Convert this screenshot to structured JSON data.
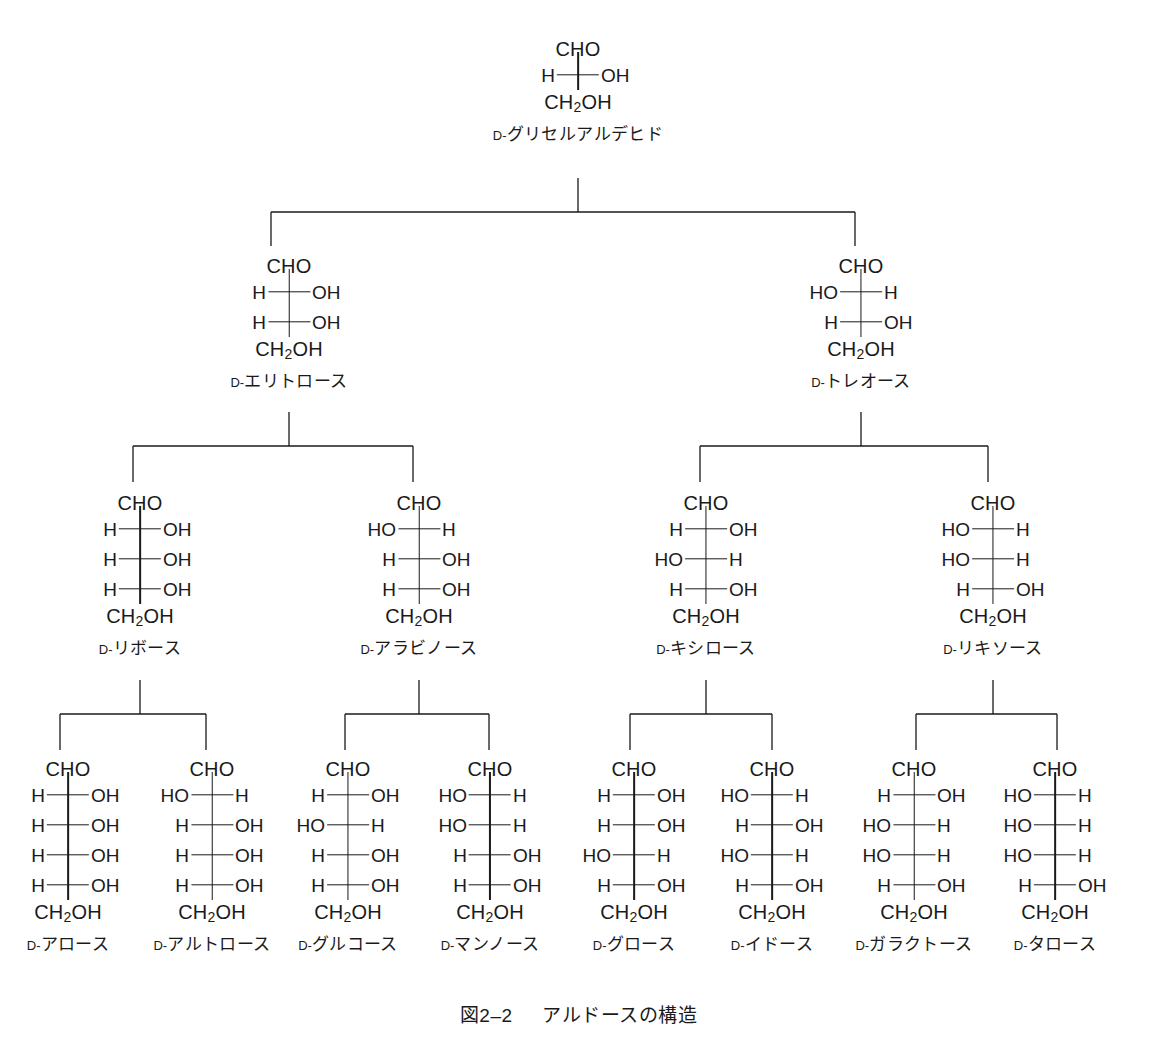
{
  "figure": {
    "caption_number": "図2–2",
    "caption_title": "アルドースの構造",
    "prefix": "D-",
    "aldehyde_group": "CHO",
    "primary_alcohol": "CH",
    "primary_alcohol_sub": "2",
    "primary_alcohol_tail": "OH",
    "hydroxyl_label": "OH",
    "hydrogen_label": "H",
    "hydroxyl_left_label": "HO"
  },
  "chart_data": {
    "type": "diagram",
    "generations": [
      {
        "level": 1,
        "carbons": 3,
        "label": "triose"
      },
      {
        "level": 2,
        "carbons": 4,
        "label": "tetrose"
      },
      {
        "level": 3,
        "carbons": 5,
        "label": "pentose"
      },
      {
        "level": 4,
        "carbons": 6,
        "label": "hexose"
      }
    ],
    "nodes": [
      {
        "id": "glyceraldehyde",
        "name": "グリセルアルデヒド",
        "prefix": "D-",
        "row": 1,
        "x": 578,
        "y": 38,
        "centers": [
          "R"
        ],
        "parent": null
      },
      {
        "id": "erythrose",
        "name": "エリトロース",
        "prefix": "D-",
        "row": 2,
        "x": 289,
        "y": 255,
        "centers": [
          "R",
          "R"
        ],
        "parent": "glyceraldehyde"
      },
      {
        "id": "threose",
        "name": "トレオース",
        "prefix": "D-",
        "row": 2,
        "x": 861,
        "y": 255,
        "centers": [
          "L",
          "R"
        ],
        "parent": "glyceraldehyde"
      },
      {
        "id": "ribose",
        "name": "リボース",
        "prefix": "D-",
        "row": 3,
        "x": 140,
        "y": 492,
        "centers": [
          "R",
          "R",
          "R"
        ],
        "parent": "erythrose"
      },
      {
        "id": "arabinose",
        "name": "アラビノース",
        "prefix": "D-",
        "row": 3,
        "x": 419,
        "y": 492,
        "centers": [
          "L",
          "R",
          "R"
        ],
        "parent": "erythrose"
      },
      {
        "id": "xylose",
        "name": "キシロース",
        "prefix": "D-",
        "row": 3,
        "x": 706,
        "y": 492,
        "centers": [
          "R",
          "L",
          "R"
        ],
        "parent": "threose"
      },
      {
        "id": "lyxose",
        "name": "リキソース",
        "prefix": "D-",
        "row": 3,
        "x": 993,
        "y": 492,
        "centers": [
          "L",
          "L",
          "R"
        ],
        "parent": "threose"
      },
      {
        "id": "allose",
        "name": "アロース",
        "prefix": "D-",
        "row": 4,
        "x": 68,
        "y": 758,
        "centers": [
          "R",
          "R",
          "R",
          "R"
        ],
        "parent": "ribose"
      },
      {
        "id": "altrose",
        "name": "アルトロース",
        "prefix": "D-",
        "row": 4,
        "x": 212,
        "y": 758,
        "centers": [
          "L",
          "R",
          "R",
          "R"
        ],
        "parent": "ribose"
      },
      {
        "id": "glucose",
        "name": "グルコース",
        "prefix": "D-",
        "row": 4,
        "x": 348,
        "y": 758,
        "centers": [
          "R",
          "L",
          "R",
          "R"
        ],
        "parent": "arabinose"
      },
      {
        "id": "mannose",
        "name": "マンノース",
        "prefix": "D-",
        "row": 4,
        "x": 490,
        "y": 758,
        "centers": [
          "L",
          "L",
          "R",
          "R"
        ],
        "parent": "arabinose"
      },
      {
        "id": "gulose",
        "name": "グロース",
        "prefix": "D-",
        "row": 4,
        "x": 634,
        "y": 758,
        "centers": [
          "R",
          "R",
          "L",
          "R"
        ],
        "parent": "xylose"
      },
      {
        "id": "idose",
        "name": "イドース",
        "prefix": "D-",
        "row": 4,
        "x": 772,
        "y": 758,
        "centers": [
          "L",
          "R",
          "L",
          "R"
        ],
        "parent": "xylose"
      },
      {
        "id": "galactose",
        "name": "ガラクトース",
        "prefix": "D-",
        "row": 4,
        "x": 914,
        "y": 758,
        "centers": [
          "R",
          "L",
          "L",
          "R"
        ],
        "parent": "galactose_parent_lyxose"
      },
      {
        "id": "talose",
        "name": "タロース",
        "prefix": "D-",
        "row": 4,
        "x": 1055,
        "y": 758,
        "centers": [
          "L",
          "L",
          "L",
          "R"
        ],
        "parent": "lyxose"
      }
    ],
    "connectors": [
      {
        "parent_x": 578,
        "y_top": 178,
        "y_bar": 212,
        "y_bot": 246,
        "children_x": [
          271,
          855
        ]
      },
      {
        "parent_x": 289,
        "y_top": 412,
        "y_bar": 446,
        "y_bot": 482,
        "children_x": [
          133,
          413
        ]
      },
      {
        "parent_x": 861,
        "y_top": 412,
        "y_bar": 446,
        "y_bot": 482,
        "children_x": [
          700,
          988
        ]
      },
      {
        "parent_x": 140,
        "y_top": 680,
        "y_bar": 714,
        "y_bot": 750,
        "children_x": [
          60,
          206
        ]
      },
      {
        "parent_x": 419,
        "y_top": 680,
        "y_bar": 714,
        "y_bot": 750,
        "children_x": [
          345,
          489
        ]
      },
      {
        "parent_x": 706,
        "y_top": 680,
        "y_bar": 714,
        "y_bot": 750,
        "children_x": [
          630,
          772
        ]
      },
      {
        "parent_x": 993,
        "y_top": 680,
        "y_bar": 714,
        "y_bot": 750,
        "children_x": [
          916,
          1057
        ]
      }
    ],
    "caption": {
      "number": "図2–2",
      "title": "アルドースの構造",
      "x": 578,
      "y": 1000
    }
  }
}
